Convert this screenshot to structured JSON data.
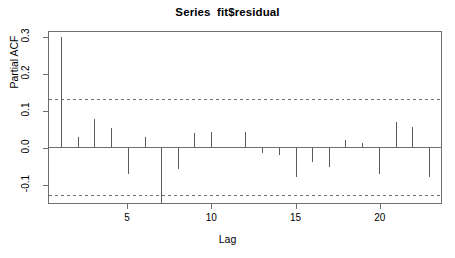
{
  "chart_data": {
    "type": "bar",
    "title": "Series  fit$residual",
    "xlabel": "Lag",
    "ylabel": "Partial ACF",
    "categories": [
      1,
      2,
      3,
      4,
      5,
      6,
      7,
      8,
      9,
      10,
      11,
      12,
      13,
      14,
      15,
      16,
      17,
      18,
      19,
      20,
      21,
      22,
      23
    ],
    "values": [
      0.3,
      0.027,
      0.077,
      0.053,
      -0.073,
      0.027,
      -0.155,
      -0.06,
      0.04,
      0.042,
      0.0,
      0.041,
      -0.016,
      -0.022,
      -0.08,
      -0.04,
      -0.055,
      0.02,
      0.013,
      -0.074,
      0.068,
      0.055,
      -0.08
    ],
    "series": [
      {
        "name": "Partial ACF",
        "values": [
          0.3,
          0.027,
          0.077,
          0.053,
          -0.073,
          0.027,
          -0.155,
          -0.06,
          0.04,
          0.042,
          0.0,
          0.041,
          -0.016,
          -0.022,
          -0.08,
          -0.04,
          -0.055,
          0.02,
          0.013,
          -0.074,
          0.068,
          0.055,
          -0.08
        ]
      }
    ],
    "xlim": [
      0.3,
      23.7
    ],
    "ylim": [
      -0.152,
      0.315
    ],
    "xticks": [
      5,
      10,
      15,
      20
    ],
    "xtick_labels": [
      "5",
      "10",
      "15",
      "20"
    ],
    "yticks": [
      -0.1,
      0.0,
      0.1,
      0.2,
      0.3
    ],
    "ytick_labels": [
      "-0.1",
      "0.0",
      "0.1",
      "0.2",
      "0.3"
    ],
    "grid": false,
    "legend": null,
    "reference_lines": [
      {
        "name": "zero-line",
        "value": 0.0,
        "style": "solid"
      },
      {
        "name": "upper-confidence-band",
        "value": 0.132,
        "style": "dashed"
      },
      {
        "name": "lower-confidence-band",
        "value": -0.132,
        "style": "dashed"
      }
    ],
    "colors": {
      "axis": "#6e6e6e",
      "bar": "#5a5a5a",
      "reference": "#6e6e6e",
      "background": "#ffffff"
    }
  }
}
